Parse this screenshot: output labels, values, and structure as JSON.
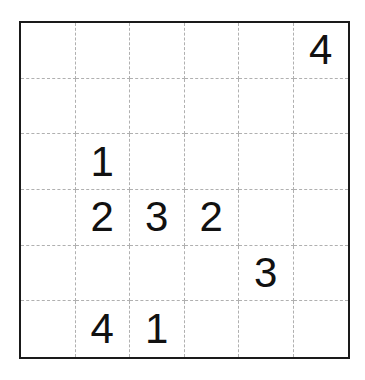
{
  "puzzle": {
    "rows": 6,
    "cols": 6,
    "grid": [
      [
        "",
        "",
        "",
        "",
        "",
        "4"
      ],
      [
        "",
        "",
        "",
        "",
        "",
        ""
      ],
      [
        "",
        "1",
        "",
        "",
        "",
        ""
      ],
      [
        "",
        "2",
        "3",
        "2",
        "",
        ""
      ],
      [
        "",
        "",
        "",
        "",
        "3",
        ""
      ],
      [
        "",
        "4",
        "1",
        "",
        "",
        ""
      ]
    ]
  }
}
